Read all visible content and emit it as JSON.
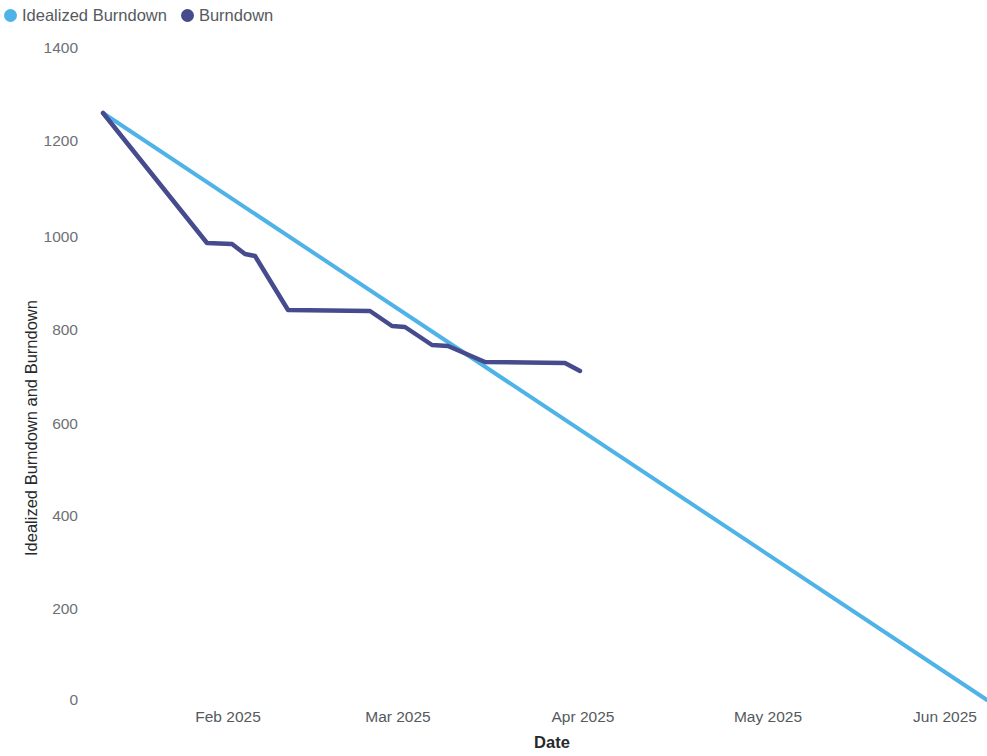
{
  "legend": {
    "position": "top-left",
    "items": [
      {
        "label": "Idealized Burndown",
        "color": "#4FB3E8",
        "marker": "legend-dot-icon"
      },
      {
        "label": "Burndown",
        "color": "#454B8C",
        "marker": "legend-dot-icon"
      }
    ]
  },
  "axes": {
    "x_title": "Date",
    "y_title": "Idealized Burndown and Burndown",
    "y_ticks": [
      "1400",
      "1200",
      "1000",
      "800",
      "600",
      "400",
      "200",
      "0"
    ],
    "x_ticks": [
      "Feb 2025",
      "Mar 2025",
      "Apr 2025",
      "May 2025",
      "Jun 2025"
    ]
  },
  "chart_data": {
    "type": "line",
    "title": "",
    "subtitle": "",
    "xlabel": "Date",
    "ylabel": "Idealized Burndown and Burndown",
    "xlim": [
      "2025-01-11",
      "2025-06-20"
    ],
    "ylim": [
      0,
      1400
    ],
    "yticks": [
      0,
      200,
      400,
      600,
      800,
      1000,
      1200,
      1400
    ],
    "xticks": [
      "Feb 2025",
      "Mar 2025",
      "Apr 2025",
      "May 2025",
      "Jun 2025"
    ],
    "grid": false,
    "legend_position": "top-left",
    "series": [
      {
        "name": "Idealized Burndown",
        "color": "#4FB3E8",
        "points": [
          {
            "x": "2025-01-11",
            "y": 1265
          },
          {
            "x": "2025-06-20",
            "y": 0
          }
        ]
      },
      {
        "name": "Burndown",
        "color": "#454B8C",
        "points": [
          {
            "x": "2025-01-11",
            "y": 1265
          },
          {
            "x": "2025-01-29",
            "y": 1015
          },
          {
            "x": "2025-02-03",
            "y": 1012
          },
          {
            "x": "2025-02-07",
            "y": 985
          },
          {
            "x": "2025-02-12",
            "y": 983
          },
          {
            "x": "2025-02-24",
            "y": 840
          },
          {
            "x": "2025-03-09",
            "y": 840
          },
          {
            "x": "2025-03-13",
            "y": 808
          },
          {
            "x": "2025-03-16",
            "y": 806
          },
          {
            "x": "2025-03-22",
            "y": 765
          },
          {
            "x": "2025-03-25",
            "y": 763
          },
          {
            "x": "2025-03-31",
            "y": 728
          },
          {
            "x": "2025-04-15",
            "y": 727
          },
          {
            "x": "2025-04-18",
            "y": 708
          }
        ]
      }
    ]
  },
  "geometry": {
    "y_pixels": {
      "1400": 48,
      "1200": 141,
      "1000": 237,
      "800": 330,
      "600": 424,
      "400": 516,
      "200": 609,
      "0": 700
    },
    "x_pixels": {
      "Feb 2025": 228,
      "Mar 2025": 398,
      "Apr 2025": 583,
      "May 2025": 768,
      "Jun 2025": 945
    },
    "ideal_path": "M 103 113 L 987 700",
    "burndown_path": "M 103 113 L 207 243 L 232 244 L 245 254 L 255 256 L 288 310 L 370 311 L 392 326 L 405 327 L 432 345 L 448 346 L 485 362 L 565 363 L 580 371"
  }
}
